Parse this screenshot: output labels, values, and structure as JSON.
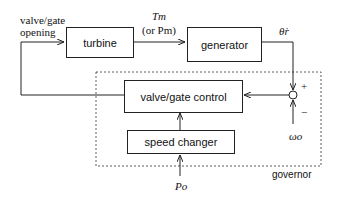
{
  "blocks": {
    "turbine": "turbine",
    "generator": "generator",
    "valve_gate_control": "valve/gate control",
    "speed_changer": "speed changer"
  },
  "labels": {
    "valve_gate_opening_1": "valve/gate",
    "valve_gate_opening_2": "opening",
    "tm": "Tm",
    "or_pm": "(or Pm)",
    "theta_r_dot": "θ̇r",
    "plus": "+",
    "minus": "−",
    "omega_o": "ωo",
    "p_o": "Po",
    "governor": "governor"
  }
}
